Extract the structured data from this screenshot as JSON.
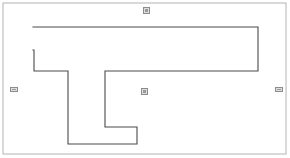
{
  "document": {
    "title": "Floor Plan Outline",
    "canvas_width": 290,
    "canvas_height": 158,
    "background_color": "#ffffff"
  },
  "frame": {
    "name": "page-border",
    "x": 3,
    "y": 3,
    "width": 283,
    "height": 151,
    "stroke_color": "#b4b4b4",
    "stroke_width": 1,
    "fill": "none"
  },
  "shape": {
    "name": "building-outline",
    "type": "polygon",
    "stroke_color": "#4a4a4a",
    "stroke_width": 1.1,
    "fill": "none",
    "points": "33,27 258,27 258,71 105,71 105,127 137,127 137,144 68,144 68,71 34,71 34,50 33,50",
    "vertices": [
      {
        "x": 33,
        "y": 27
      },
      {
        "x": 258,
        "y": 27
      },
      {
        "x": 258,
        "y": 71
      },
      {
        "x": 105,
        "y": 71
      },
      {
        "x": 105,
        "y": 127
      },
      {
        "x": 137,
        "y": 127
      },
      {
        "x": 137,
        "y": 144
      },
      {
        "x": 68,
        "y": 144
      },
      {
        "x": 68,
        "y": 71
      },
      {
        "x": 34,
        "y": 71
      },
      {
        "x": 34,
        "y": 50
      },
      {
        "x": 33,
        "y": 50
      }
    ]
  },
  "handles": [
    {
      "name": "handle-top",
      "position": "top",
      "orientation": "vertical",
      "x": 143,
      "y": 7
    },
    {
      "name": "handle-left",
      "position": "left",
      "orientation": "horizontal",
      "x": 10,
      "y": 87
    },
    {
      "name": "handle-center",
      "position": "center",
      "orientation": "vertical",
      "x": 141,
      "y": 88
    },
    {
      "name": "handle-right",
      "position": "right",
      "orientation": "horizontal",
      "x": 275,
      "y": 87
    }
  ],
  "colors": {
    "outline_stroke": "#4a4a4a",
    "frame_stroke": "#b4b4b4",
    "handle_fill": "#dedede",
    "handle_border": "#8c8c8c",
    "background": "#ffffff"
  }
}
